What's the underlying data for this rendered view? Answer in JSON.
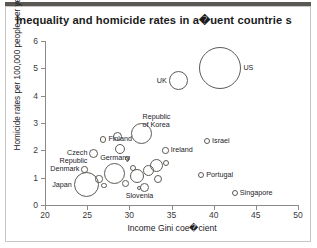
{
  "chart_data": {
    "type": "scatter",
    "title": "Inequality and homicide rates in a�uent countrie s",
    "xlabel": "Income Gini coe�cient",
    "ylabel": "Homicide rates per 100,000 people per year",
    "xlim": [
      20,
      50
    ],
    "ylim": [
      0,
      6
    ],
    "xticks": [
      "20",
      "25",
      "30",
      "35",
      "40",
      "45",
      "50"
    ],
    "yticks": [
      "0",
      "1",
      "2",
      "3",
      "4",
      "5",
      "6"
    ],
    "grid": false,
    "legend": "none",
    "note": "Bubble (scatter) chart; marker area scales with population. Unlabelled bubbles form a dense central cluster.",
    "points": [
      {
        "label": "US",
        "x": 40.8,
        "y": 5.0,
        "r": 21.0,
        "label_pos": "right"
      },
      {
        "label": "UK",
        "x": 35.8,
        "y": 4.55,
        "r": 9.5,
        "label_pos": "left"
      },
      {
        "label": "Republic of Korea",
        "x": 31.5,
        "y": 2.6,
        "r": 10.5,
        "label_pos": "above-right"
      },
      {
        "label": "Israel",
        "x": 39.2,
        "y": 2.35,
        "r": 3.2,
        "label_pos": "right"
      },
      {
        "label": "Finland",
        "x": 26.9,
        "y": 2.4,
        "r": 3.2,
        "label_pos": "right"
      },
      {
        "label": "Ireland",
        "x": 34.3,
        "y": 2.0,
        "r": 3.2,
        "label_pos": "right"
      },
      {
        "label": "Czech Republic",
        "x": 25.8,
        "y": 1.9,
        "r": 4.5,
        "label_pos": "left"
      },
      {
        "label": "Denmark",
        "x": 24.7,
        "y": 1.3,
        "r": 3.2,
        "label_pos": "left"
      },
      {
        "label": "Germany",
        "x": 28.3,
        "y": 1.15,
        "r": 10.5,
        "label_pos": "above"
      },
      {
        "label": "Japan",
        "x": 24.9,
        "y": 0.75,
        "r": 12.5,
        "label_pos": "left"
      },
      {
        "label": "Portugal",
        "x": 38.5,
        "y": 1.1,
        "r": 3.2,
        "label_pos": "right"
      },
      {
        "label": "Slovenia",
        "x": 31.2,
        "y": 0.62,
        "r": 2.0,
        "label_pos": "below"
      },
      {
        "label": "Singapore",
        "x": 42.5,
        "y": 0.45,
        "r": 3.0,
        "label_pos": "right"
      }
    ],
    "unlabelled_bubbles": [
      {
        "x": 26.4,
        "y": 0.95,
        "r": 3.6
      },
      {
        "x": 27.0,
        "y": 0.72,
        "r": 2.6
      },
      {
        "x": 29.5,
        "y": 0.78,
        "r": 3.4
      },
      {
        "x": 30.4,
        "y": 1.35,
        "r": 3.2
      },
      {
        "x": 30.9,
        "y": 1.05,
        "r": 7.0
      },
      {
        "x": 32.3,
        "y": 1.25,
        "r": 5.5
      },
      {
        "x": 33.2,
        "y": 1.45,
        "r": 6.5
      },
      {
        "x": 33.4,
        "y": 0.95,
        "r": 4.0
      },
      {
        "x": 31.8,
        "y": 0.65,
        "r": 4.4
      },
      {
        "x": 34.4,
        "y": 1.55,
        "r": 3.0
      },
      {
        "x": 29.8,
        "y": 1.7,
        "r": 2.4
      },
      {
        "x": 28.9,
        "y": 2.05,
        "r": 5.0
      },
      {
        "x": 28.6,
        "y": 2.5,
        "r": 4.6
      }
    ]
  },
  "colors": {
    "title_bar": "#595855",
    "axis": "#8d8b87",
    "marker_stroke": "#5d5b57",
    "text": "#23231f",
    "frame": "#c8c6c2"
  }
}
